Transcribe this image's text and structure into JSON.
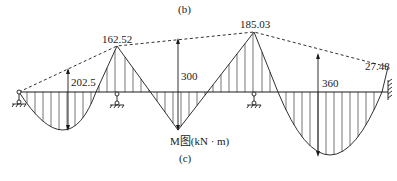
{
  "figure": {
    "top_caption": "(b)",
    "bottom_caption": "(c)",
    "diagram_title": "M图(kN · m)",
    "diagram_type": "bending moment diagram of continuous beam"
  },
  "supports": [
    {
      "type": "pin",
      "name": "left-pin-support"
    },
    {
      "type": "roller",
      "name": "support-2"
    },
    {
      "type": "roller",
      "name": "support-3"
    },
    {
      "type": "fixed",
      "name": "right-fixed-support"
    }
  ],
  "moments": {
    "support_2_hogging": "162.52",
    "support_3_hogging": "185.03",
    "fixed_end_hogging": "27.48",
    "span_1_simple_max": "202.5",
    "span_2_simple_max": "300",
    "span_3_simple_max": "360"
  },
  "colors": {
    "ink": "#1a1a1a",
    "background": "#ffffff"
  }
}
